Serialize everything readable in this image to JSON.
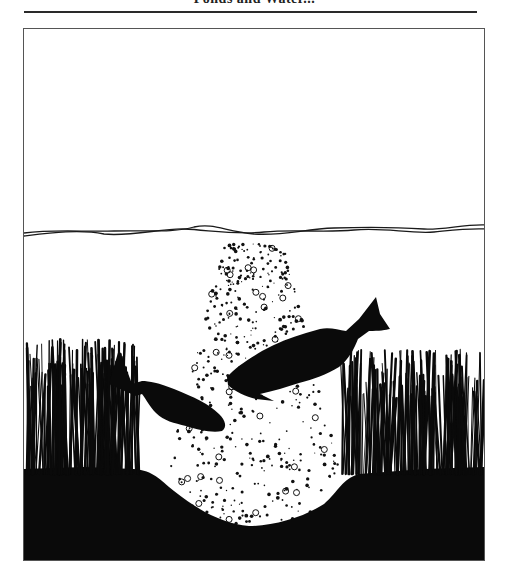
{
  "header": {
    "title_fragment": "Ponds and Water..."
  },
  "illustration": {
    "subject": "two fish swimming above an aeration bubble plume in a pond",
    "elements": [
      "water-surface",
      "bubble-plume",
      "large-fish",
      "small-fish",
      "left-grass",
      "right-grass",
      "pond-bottom"
    ],
    "colors": {
      "ink": "#0a0a0a",
      "paper": "#ffffff",
      "frame": "#555555"
    }
  }
}
